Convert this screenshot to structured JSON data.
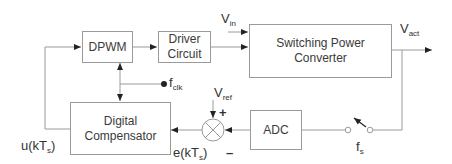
{
  "diagram": {
    "blocks": {
      "dpwm": "DPWM",
      "driver_line1": "Driver",
      "driver_line2": "Circuit",
      "converter_line1": "Switching Power",
      "converter_line2": "Converter",
      "compensator_line1": "Digital",
      "compensator_line2": "Compensator",
      "adc": "ADC"
    },
    "labels": {
      "vin_main": "V",
      "vin_sub": "in",
      "vact_main": "V",
      "vact_sub": "act",
      "vref_main": "V",
      "vref_sub": "ref",
      "fclk_main": "f",
      "fclk_sub": "clk",
      "fs_main": "f",
      "fs_sub": "s",
      "u_pre": "u(kT",
      "u_sub": "s",
      "u_post": ")",
      "e_pre": "e(kT",
      "e_sub": "s",
      "e_post": ")",
      "plus": "+",
      "minus": "–"
    },
    "colors": {
      "line": "#9a9a9a",
      "arrow": "#222222",
      "text": "#333333"
    }
  }
}
